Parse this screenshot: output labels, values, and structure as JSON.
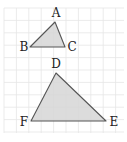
{
  "diagram": {
    "type": "similar-triangles-on-grid",
    "grid": {
      "x0": 4,
      "y0": 8,
      "x1": 124,
      "y1": 133,
      "spacing": 12.4,
      "color": "#e6e6e6"
    },
    "colors": {
      "fill": "#d6d6d6",
      "stroke": "#555555",
      "label": "#222222",
      "background": "#ffffff"
    },
    "triangles": [
      {
        "name": "ABC",
        "vertices": [
          {
            "id": "A",
            "x": 55,
            "y": 22,
            "label": "A",
            "lx": 56,
            "ly": 17,
            "anchor": "middle"
          },
          {
            "id": "B",
            "x": 30,
            "y": 47,
            "label": "B",
            "lx": 24,
            "ly": 51,
            "anchor": "middle"
          },
          {
            "id": "C",
            "x": 65,
            "y": 47,
            "label": "C",
            "lx": 72,
            "ly": 51,
            "anchor": "middle"
          }
        ]
      },
      {
        "name": "DEF",
        "vertices": [
          {
            "id": "D",
            "x": 56,
            "y": 73,
            "label": "D",
            "lx": 56,
            "ly": 68,
            "anchor": "middle"
          },
          {
            "id": "E",
            "x": 106,
            "y": 121,
            "label": "E",
            "lx": 114,
            "ly": 126,
            "anchor": "middle"
          },
          {
            "id": "F",
            "x": 31,
            "y": 121,
            "label": "F",
            "lx": 24,
            "ly": 126,
            "anchor": "middle"
          }
        ]
      }
    ]
  }
}
